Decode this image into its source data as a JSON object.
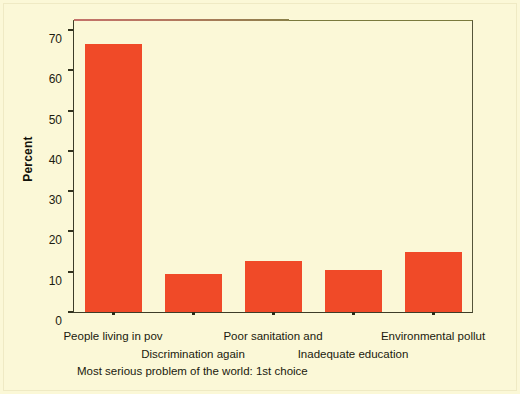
{
  "chart_data": {
    "type": "bar",
    "title": "",
    "caption": "Most serious problem of the world: 1st choice",
    "xlabel": "",
    "ylabel": "Percent",
    "ylim": [
      0,
      72
    ],
    "yticks": [
      0,
      10,
      20,
      30,
      40,
      50,
      60,
      70
    ],
    "ytick_labels": [
      "0",
      "10",
      "20",
      "30",
      "40",
      "50",
      "60",
      "70"
    ],
    "grid": false,
    "legend": false,
    "bar_color": "#f04a28",
    "background_color": "#fbf8d7",
    "axis_color": "#3d3d28",
    "categories": [
      "People living in pov",
      "Discrimination again",
      "Poor sanitation and",
      "Inadequate education",
      "Environmental pollut"
    ],
    "values": [
      66.5,
      9.4,
      12.7,
      10.4,
      14.8
    ],
    "label_rows": [
      {
        "row": 0,
        "labels": [
          "People living in pov",
          "Poor sanitation and",
          "Environmental pollut"
        ]
      },
      {
        "row": 1,
        "labels": [
          "Discrimination again",
          "Inadequate education"
        ]
      }
    ]
  },
  "axis": {
    "y_title": "Percent"
  }
}
